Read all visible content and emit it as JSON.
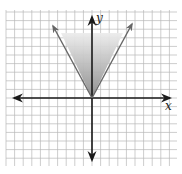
{
  "chart_data": {
    "type": "line",
    "title": "",
    "xlabel": "x",
    "ylabel": "y",
    "grid": true,
    "legend": null,
    "xlim": [
      -10,
      10
    ],
    "ylim": [
      -8,
      10
    ],
    "grid_step": 1,
    "series": [
      {
        "name": "boundary y = 2|x|",
        "style": "solid, arrows on both ends",
        "points": [
          [
            -4.6,
            8.5
          ],
          [
            0,
            0
          ],
          [
            4.6,
            8.5
          ]
        ]
      }
    ],
    "shaded_region": {
      "description": "region above y = 2|x| (inequality y >= 2|x|), shaded gray, darker near vertex",
      "vertices": [
        [
          -3.5,
          7.5
        ],
        [
          0,
          0
        ],
        [
          3.5,
          7.5
        ]
      ]
    },
    "axes": {
      "x_axis_arrows": "both",
      "y_axis_arrows": "both",
      "x_label": "x",
      "y_label": "y"
    }
  },
  "labels": {
    "x_axis": "x",
    "y_axis": "y"
  },
  "colors": {
    "grid": "#b8b8b8",
    "grid_border": "#cfcfcf",
    "axis": "#1a1a1a",
    "ray": "#666666",
    "shade_light": "#e6e6e6",
    "shade_dark": "#8c8c8c"
  }
}
